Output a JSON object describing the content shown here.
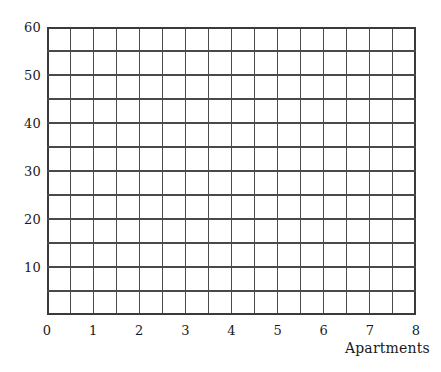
{
  "chart_data": {
    "type": "grid",
    "title": "",
    "subtitle": "",
    "xlabel": "Apartments",
    "ylabel": "",
    "xlim": [
      0,
      8
    ],
    "ylim": [
      0,
      60
    ],
    "x_tick_labels": [
      "0",
      "1",
      "2",
      "3",
      "4",
      "5",
      "6",
      "7",
      "8"
    ],
    "x_tick_values": [
      0,
      1,
      2,
      3,
      4,
      5,
      6,
      7,
      8
    ],
    "y_tick_labels": [
      "10",
      "20",
      "30",
      "40",
      "50",
      "60"
    ],
    "y_tick_values": [
      10,
      20,
      30,
      40,
      50,
      60
    ],
    "x_gridline_step": 0.5,
    "y_gridline_step": 5,
    "x_gridline_count": 17,
    "y_gridline_count": 13,
    "grid": true,
    "legend": null,
    "series": [],
    "values": [],
    "annotations": [],
    "note": "Empty blank grid / graph paper template with no plotted data series."
  },
  "style": {
    "background_color": "#ffffff",
    "grid_color": "#4a4a4a",
    "axis_color": "#3a3a3a",
    "text_color": "#1a1a1a",
    "grid_line_width": 1.1,
    "axis_line_width": 1.6
  },
  "axis_title": {
    "x": "Apartments"
  }
}
